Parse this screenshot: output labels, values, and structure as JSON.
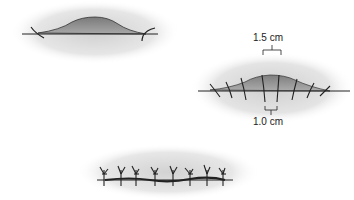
{
  "figure": {
    "panels": [
      {
        "id": "wound-open",
        "description": "Wound edges with gap"
      },
      {
        "id": "wound-sutured-measured",
        "description": "Interrupted sutures with spacing measurements"
      },
      {
        "id": "wound-closed",
        "description": "Closed wound with interrupted sutures"
      }
    ],
    "measurements": {
      "suture_spacing": "1.5 cm",
      "bite_distance": "1.0 cm"
    },
    "colors": {
      "wound_fill": "#8a8a8a",
      "wound_shade": "#b0b0b0",
      "line": "#222222",
      "halo": "#d9d9d9"
    }
  }
}
